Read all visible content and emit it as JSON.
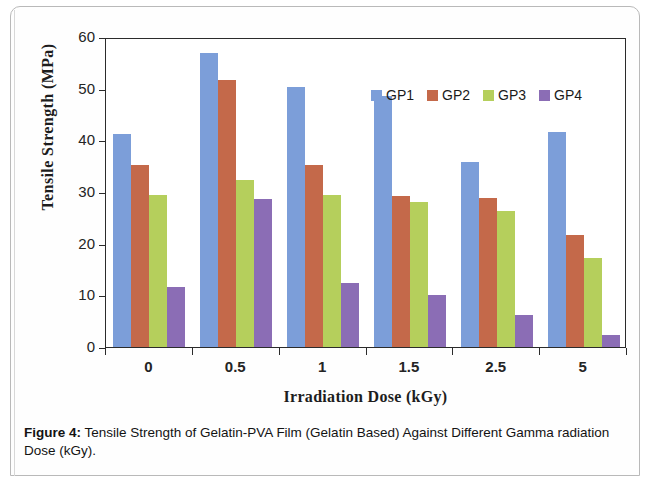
{
  "caption": {
    "figure_number": "Figure 4:",
    "text": " Tensile Strength of Gelatin-PVA Film (Gelatin Based) Against Different Gamma radiation Dose (kGy)."
  },
  "chart_data": {
    "type": "bar",
    "title": "",
    "xlabel": "Irradiation Dose (kGy)",
    "ylabel": "Tensile Strength (MPa)",
    "categories": [
      "0",
      "0.5",
      "1",
      "1.5",
      "2.5",
      "5"
    ],
    "ylim": [
      0,
      60
    ],
    "yticks": [
      "0",
      "10",
      "20",
      "30",
      "40",
      "50",
      "60"
    ],
    "grid": false,
    "legend_position": "top-center",
    "series": [
      {
        "name": "GP1",
        "color": "#7c9ed9",
        "values": [
          41.3,
          57.0,
          50.3,
          48.6,
          35.9,
          41.7
        ]
      },
      {
        "name": "GP2",
        "color": "#c4694a",
        "values": [
          35.2,
          51.6,
          35.2,
          29.3,
          28.9,
          21.6
        ]
      },
      {
        "name": "GP3",
        "color": "#b5cf5c",
        "values": [
          29.4,
          32.3,
          29.4,
          28.0,
          26.3,
          17.3
        ]
      },
      {
        "name": "GP4",
        "color": "#8b6db5",
        "values": [
          11.7,
          28.7,
          12.3,
          10.0,
          6.1,
          2.4
        ]
      }
    ]
  }
}
